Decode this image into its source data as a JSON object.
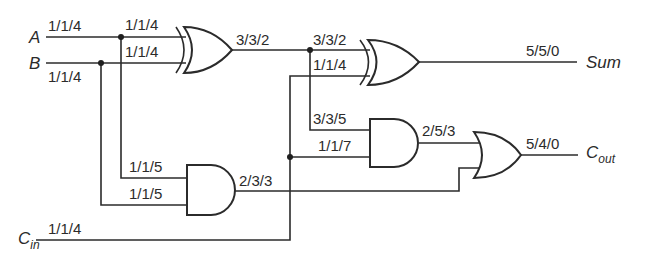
{
  "diagram": {
    "type": "full-adder-gate-circuit",
    "inputs": [
      {
        "name": "A",
        "label": "1/1/4"
      },
      {
        "name": "B",
        "label": "1/1/4"
      },
      {
        "name": "C",
        "subscript": "in",
        "label": "1/1/4"
      }
    ],
    "outputs": [
      {
        "name": "Sum",
        "label": "5/5/0"
      },
      {
        "name": "C",
        "subscript": "out",
        "label": "5/4/0"
      }
    ],
    "gates": {
      "xor1": {
        "type": "XOR",
        "in1_label": "1/1/4",
        "in2_label": "1/1/4",
        "out_label": "3/3/2"
      },
      "xor2": {
        "type": "XOR",
        "in1_label": "3/3/2",
        "in2_label": "1/1/4",
        "out_label": "5/5/0"
      },
      "and1": {
        "type": "AND",
        "in1_label": "3/3/5",
        "in2_label": "1/1/7",
        "out_label": "2/5/3"
      },
      "and2": {
        "type": "AND",
        "in1_label": "1/1/5",
        "in2_label": "1/1/5",
        "out_label": "2/3/3"
      },
      "or1": {
        "type": "OR",
        "out_label": "5/4/0"
      }
    }
  }
}
